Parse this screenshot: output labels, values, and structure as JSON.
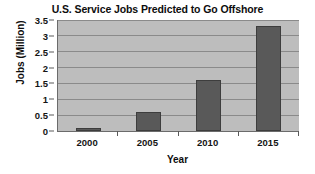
{
  "chart_data": {
    "type": "bar",
    "title": "U.S. Service Jobs Predicted to Go Offshore",
    "xlabel": "Year",
    "ylabel": "Jobs (Million)",
    "categories": [
      "2000",
      "2005",
      "2010",
      "2015"
    ],
    "values": [
      0.1,
      0.6,
      1.6,
      3.3
    ],
    "ylim": [
      0,
      3.5
    ],
    "yticks": [
      0,
      0.5,
      1,
      1.5,
      2,
      2.5,
      3,
      3.5
    ],
    "ytick_labels": [
      "0",
      "0.5",
      "1",
      "1.5",
      "2",
      "2.5",
      "3",
      "3.5"
    ],
    "grid": true,
    "legend": false,
    "legend_position": "none",
    "series": [
      {
        "name": "Jobs (Million)",
        "values": [
          0.1,
          0.6,
          1.6,
          3.3
        ]
      }
    ],
    "colors": {
      "bar_fill": "#595959",
      "bar_edge": "#3d3d3d",
      "plot_background": "#bdbdbd",
      "gridline": "#8a8a8a",
      "axis": "#6b6b6b",
      "figure_background": "#ffffff",
      "text": "#111111"
    }
  }
}
